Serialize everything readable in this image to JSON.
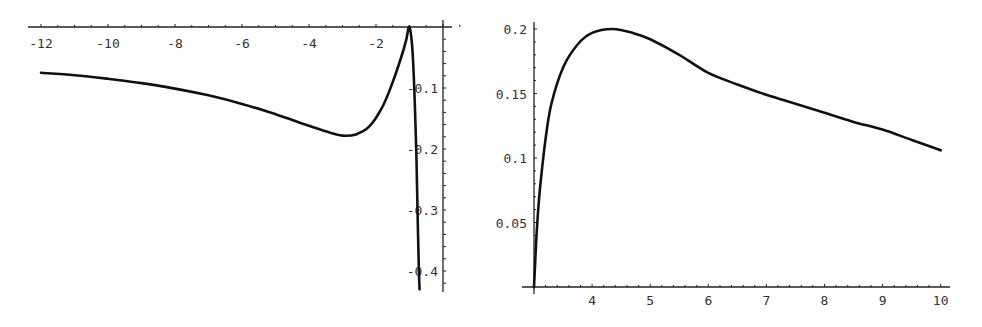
{
  "chart_data": [
    {
      "type": "line",
      "title": "",
      "xlabel": "",
      "ylabel": "",
      "xlim": [
        -12.1,
        0.9
      ],
      "ylim": [
        -0.43,
        0.0
      ],
      "grid": false,
      "legend": null,
      "x_ticks": [
        -12,
        -10,
        -8,
        -6,
        -4,
        -2
      ],
      "x_tick_labels": [
        "-12",
        "-10",
        "-8",
        "-6",
        "-4",
        "-2"
      ],
      "y_ticks": [
        -0.1,
        -0.2,
        -0.3,
        -0.4
      ],
      "y_tick_labels": [
        "-0.1",
        "-0.2",
        "-0.3",
        "-0.4"
      ],
      "series": [
        {
          "name": "curve",
          "x": [
            -12,
            -11,
            -10,
            -9,
            -8,
            -7,
            -6,
            -5,
            -4,
            -3.5,
            -3,
            -2.6,
            -2.2,
            -1.8,
            -1.5,
            -1.25,
            -1.1,
            -1.0,
            -0.9,
            -0.8,
            -0.75,
            -0.72,
            -0.7
          ],
          "y": [
            -0.075,
            -0.079,
            -0.085,
            -0.092,
            -0.101,
            -0.112,
            -0.126,
            -0.143,
            -0.162,
            -0.171,
            -0.178,
            -0.176,
            -0.163,
            -0.13,
            -0.09,
            -0.05,
            -0.022,
            0.0,
            -0.05,
            -0.2,
            -0.33,
            -0.4,
            -0.43
          ]
        }
      ]
    },
    {
      "type": "line",
      "title": "",
      "xlabel": "",
      "ylabel": "",
      "xlim": [
        3,
        10
      ],
      "ylim": [
        0,
        0.2
      ],
      "grid": false,
      "legend": null,
      "x_ticks": [
        4,
        5,
        6,
        7,
        8,
        9,
        10
      ],
      "x_tick_labels": [
        "4",
        "5",
        "6",
        "7",
        "8",
        "9",
        "10"
      ],
      "y_ticks": [
        0.05,
        0.1,
        0.15,
        0.2
      ],
      "y_tick_labels": [
        "0.05",
        "0.1",
        "0.15",
        "0.2"
      ],
      "series": [
        {
          "name": "curve",
          "x": [
            3.0,
            3.05,
            3.1,
            3.2,
            3.3,
            3.5,
            3.75,
            4.0,
            4.35,
            4.7,
            5.0,
            5.5,
            6.0,
            6.5,
            7.0,
            7.5,
            8.0,
            8.5,
            9.0,
            9.5,
            10.0
          ],
          "y": [
            0.0,
            0.045,
            0.075,
            0.115,
            0.142,
            0.17,
            0.188,
            0.197,
            0.2,
            0.197,
            0.192,
            0.18,
            0.166,
            0.157,
            0.149,
            0.142,
            0.135,
            0.128,
            0.122,
            0.114,
            0.106
          ]
        }
      ]
    }
  ]
}
